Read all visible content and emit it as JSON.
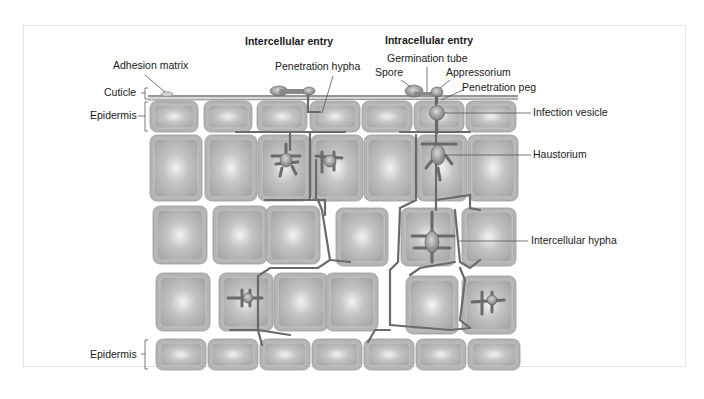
{
  "diagram": {
    "headings": {
      "intercellular": "Intercellular entry",
      "intracellular": "Intracellular entry"
    },
    "left_labels": {
      "cuticle": "Cuticle",
      "epidermis_top": "Epidermis",
      "epidermis_bottom": "Epidermis"
    },
    "callouts": {
      "adhesion_matrix": "Adhesion matrix",
      "penetration_hypha": "Penetration hypha",
      "germination_tube": "Germination tube",
      "spore": "Spore",
      "appressorium": "Appressorium",
      "penetration_peg": "Penetration peg",
      "infection_vesicle": "Infection vesicle",
      "haustorium": "Haustorium",
      "intercellular_hypha": "Intercellular hypha"
    },
    "colors": {
      "cell_fill": "#b4b4b4",
      "cell_highlight": "#eeeeee",
      "cell_border": "#9a9a9a",
      "hypha": "#6a6a6a",
      "fungus": "#8a8a8a",
      "line": "#444444"
    }
  }
}
